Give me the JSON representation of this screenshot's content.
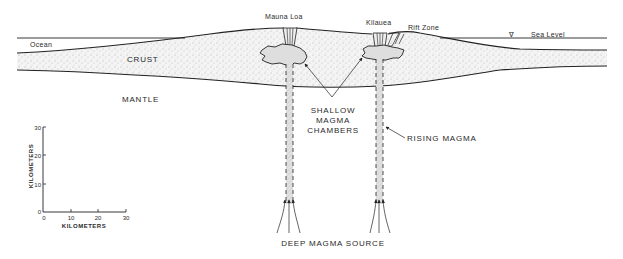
{
  "labels": {
    "ocean": "Ocean",
    "crust": "CRUST",
    "mantle": "MANTLE",
    "mauna_loa": "Mauna Loa",
    "kilauea": "Kilauea",
    "rift_zone": "Rift Zone",
    "sea_level": "Sea Level",
    "sea_level_symbol": "∇",
    "shallow_chambers_1": "SHALLOW",
    "shallow_chambers_2": "MAGMA",
    "shallow_chambers_3": "CHAMBERS",
    "rising_magma": "RISING MAGMA",
    "deep_source": "DEEP MAGMA SOURCE"
  },
  "scale": {
    "x_label": "KILOMETERS",
    "y_label": "KILOMETERS",
    "x_ticks": [
      "0",
      "10",
      "20",
      "30"
    ],
    "y_ticks": [
      "0",
      "10",
      "20",
      "30"
    ]
  },
  "colors": {
    "ink": "#222222",
    "crust_fill": "#f2f2f2",
    "magma_fill": "#dcdcdc",
    "background": "#ffffff"
  }
}
